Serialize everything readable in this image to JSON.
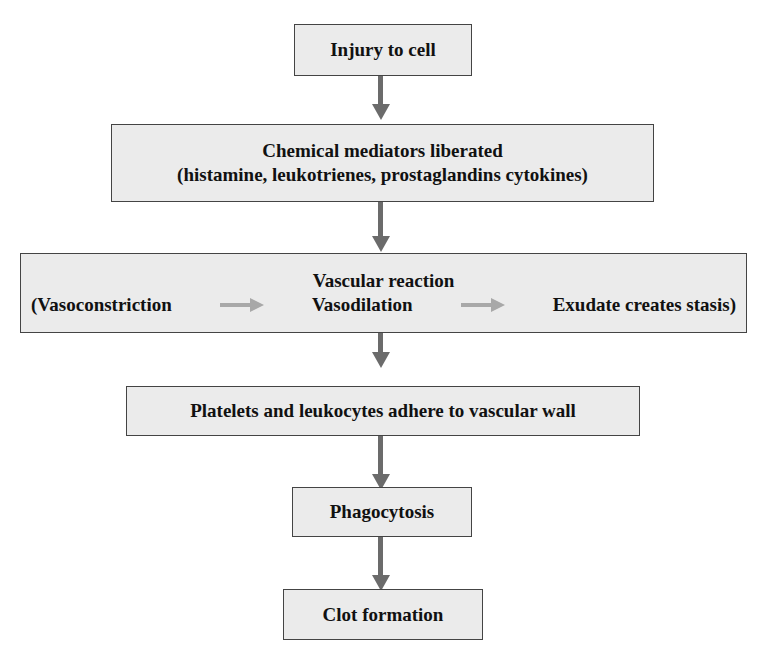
{
  "diagram": {
    "type": "flowchart",
    "steps": [
      {
        "label": "Injury to cell"
      },
      {
        "label": "Chemical mediators liberated",
        "sublabel": "(histamine, leukotrienes, prostaglandins cytokines)"
      },
      {
        "label": "Vascular reaction",
        "sequence": [
          "(Vasoconstriction",
          "Vasodilation",
          "Exudate creates stasis)"
        ]
      },
      {
        "label": "Platelets and leukocytes adhere to vascular wall"
      },
      {
        "label": "Phagocytosis"
      },
      {
        "label": "Clot formation"
      }
    ],
    "colors": {
      "box_fill": "#ebebeb",
      "box_border": "#444444",
      "arrow": "#6b6b6b",
      "inner_arrow": "#a8a8a8"
    }
  }
}
